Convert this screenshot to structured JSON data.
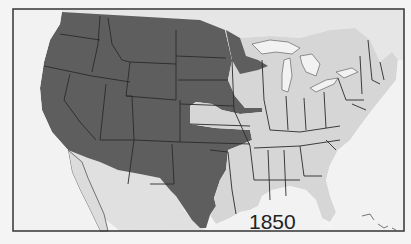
{
  "map": {
    "title": "1850",
    "year_label": "1850",
    "colors": {
      "background": "#f4f4f4",
      "water": "#f2f2f2",
      "states": "#d6d6d6",
      "territories": "#5e5e5e",
      "borders": "#2a2a2a",
      "label": "#222222"
    },
    "legend_semantics": {
      "dark": "territories / unorganized land (1850)",
      "light": "states (1850)"
    }
  }
}
